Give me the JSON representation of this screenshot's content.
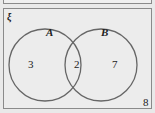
{
  "diagram": {
    "type": "venn",
    "universal_symbol": "ξ",
    "sets": [
      {
        "name": "A",
        "only_count": "3"
      },
      {
        "name": "B",
        "only_count": "7"
      }
    ],
    "intersection_count": "2",
    "outside_count": "8",
    "colors": {
      "circle_stroke": "#666666",
      "frame_stroke": "#8a8a8a",
      "background": "#ececec"
    }
  }
}
